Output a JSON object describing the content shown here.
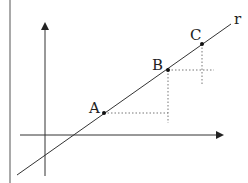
{
  "diagram": {
    "line_label": "r",
    "points": [
      {
        "label": "A"
      },
      {
        "label": "B"
      },
      {
        "label": "C"
      }
    ]
  }
}
